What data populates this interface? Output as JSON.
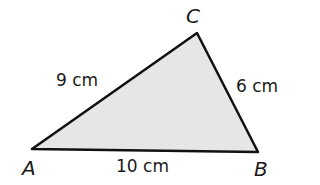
{
  "diagram": {
    "type": "triangle",
    "fill_color": "#e6e6e6",
    "stroke_color": "#111111",
    "vertices": {
      "A": {
        "label": "A",
        "x": 32,
        "y": 149
      },
      "B": {
        "label": "B",
        "x": 258,
        "y": 152
      },
      "C": {
        "label": "C",
        "x": 197,
        "y": 33
      }
    },
    "sides": {
      "AC": {
        "label": "9 cm"
      },
      "CB": {
        "label": "6 cm"
      },
      "AB": {
        "label": "10 cm"
      }
    }
  }
}
